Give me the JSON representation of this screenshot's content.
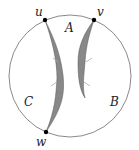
{
  "diagram": {
    "circle": {
      "cx": 70,
      "cy": 76,
      "r": 61,
      "stroke": "#888888"
    },
    "vertices": [
      {
        "id": "u",
        "label": "u",
        "x": 45,
        "y": 20
      },
      {
        "id": "v",
        "label": "v",
        "x": 94,
        "y": 20
      },
      {
        "id": "w",
        "label": "w",
        "x": 46,
        "y": 132
      }
    ],
    "regions": [
      {
        "id": "A",
        "label": "A"
      },
      {
        "id": "B",
        "label": "B"
      },
      {
        "id": "C",
        "label": "C"
      }
    ],
    "fill_color": "#888888"
  }
}
